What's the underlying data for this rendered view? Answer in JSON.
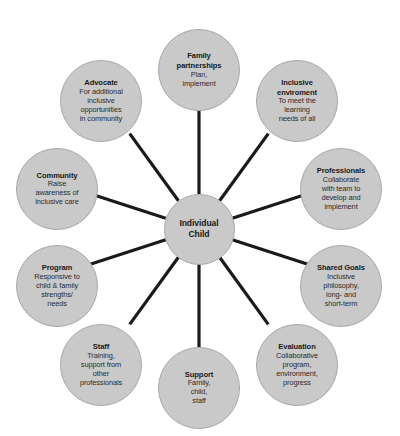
{
  "diagram": {
    "type": "radial-hub-and-spoke",
    "background_color": "#ffffff",
    "node_fill_color": "#c9c9c9",
    "node_border_color": "#a8a8a8",
    "spoke_color": "#1a1a1a",
    "center": {
      "title": "Individual",
      "title_line2": "Child"
    },
    "nodes": [
      {
        "title": "Family",
        "title_line2": "partnerships",
        "desc": "Plan,",
        "desc_line2": "implement"
      },
      {
        "title": "Inclusive",
        "title_line2": "enviroment",
        "desc": "To meet the",
        "desc_line2": "learning",
        "desc_line3": "needs of all"
      },
      {
        "title": "Professionals",
        "desc": "Collaborate",
        "desc_line2": "with team to",
        "desc_line3": "develop and",
        "desc_line4": "implement"
      },
      {
        "title": "Shared Goals",
        "desc": "Inclusive",
        "desc_line2": "philosophy,",
        "desc_line3": "long- and",
        "desc_line4": "short-term"
      },
      {
        "title": "Evaluation",
        "desc": "Collaborative",
        "desc_line2": "program,",
        "desc_line3": "environment,",
        "desc_line4": "progress"
      },
      {
        "title": "Support",
        "desc": "Family,",
        "desc_line2": "child,",
        "desc_line3": "staff"
      },
      {
        "title": "Staff",
        "desc": "Training,",
        "desc_line2": "support from",
        "desc_line3": "other",
        "desc_line4": "professionals"
      },
      {
        "title": "Program",
        "desc": "Responsive to",
        "desc_line2": "child & family",
        "desc_line3": "strengths/",
        "desc_line4": "needs"
      },
      {
        "title": "Community",
        "desc": "Raise",
        "desc_line2": "awareness of",
        "desc_line3": "inclusive care"
      },
      {
        "title": "Advocate",
        "desc": "For additional",
        "desc_line2": "inclusive",
        "desc_line3": "opportunities",
        "desc_line4": "in community"
      }
    ]
  }
}
